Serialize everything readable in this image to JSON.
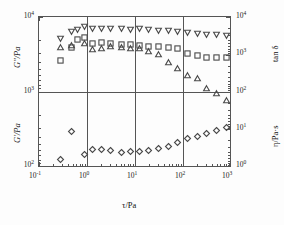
{
  "figure": {
    "name": "rheology-dual-panel-plot",
    "background": "#fdfdfd",
    "frame_color": "#555555",
    "marker_color": "#4a4a4a"
  },
  "axes": {
    "x_title": "τ/Pa",
    "y_left_top_title": "G″/Pa",
    "y_left_bottom_title": "G′/Pa",
    "y_right_top_title": "tan δ",
    "y_right_bottom_title": "η/Pa·s",
    "x_ticks": [
      "10",
      "10",
      "10",
      "10",
      "10"
    ],
    "x_tick_exponents": [
      "-1",
      "0",
      "1",
      "2",
      "3"
    ],
    "y_left_ticks": [
      "10",
      "10",
      "10"
    ],
    "y_left_exponents": [
      "4",
      "3",
      "2"
    ],
    "y_right_top_ticks": [
      "10",
      "10",
      "10"
    ],
    "y_right_top_exponents": [
      "4",
      "3",
      "2"
    ],
    "y_right_bottom_ticks": [
      "10",
      "10",
      "10"
    ],
    "y_right_bottom_exponents": [
      "2",
      "1",
      "0"
    ]
  },
  "chart_data": {
    "type": "scatter",
    "title": "",
    "xlabel": "τ/Pa",
    "ylabel": "G″/Pa, G′/Pa",
    "xscale": "log",
    "yscale": "log",
    "xlim": [
      0.1,
      1000
    ],
    "grid": "decade vertical rules at 1, 10, 100; horizontal rule at panel split",
    "legend": "none",
    "panels": [
      {
        "name": "upper-panel",
        "ylabel_left": "G″/Pa",
        "ylim_left": [
          1000,
          10000
        ],
        "ylabel_right": "tan δ",
        "ylim_right": [
          100,
          10000
        ]
      },
      {
        "name": "lower-panel",
        "ylabel_left": "G′/Pa",
        "ylim_left": [
          100,
          1000
        ],
        "ylabel_right": "η/Pa·s",
        "ylim_right": [
          1,
          100
        ]
      }
    ],
    "series": [
      {
        "name": "G-double-prime",
        "marker": "down-triangle",
        "axis": "left-upper",
        "x": [
          0.27,
          0.45,
          0.62,
          0.85,
          1.25,
          1.9,
          3.0,
          5.0,
          8.0,
          12.0,
          19.0,
          30.0,
          48.0,
          75.0,
          125.0,
          195.0,
          310.0,
          500.0,
          800.0
        ],
        "y": [
          5100,
          6500,
          6900,
          7500,
          7100,
          7050,
          7000,
          6950,
          6900,
          7050,
          6800,
          6700,
          6600,
          6500,
          6200,
          6050,
          5900,
          5800,
          5750
        ]
      },
      {
        "name": "G-double-prime-squares",
        "marker": "square",
        "axis": "left-upper",
        "x": [
          0.27,
          0.45,
          0.62,
          0.85,
          1.25,
          1.9,
          3.0,
          5.0,
          8.0,
          12.0,
          19.0,
          30.0,
          48.0,
          75.0,
          125.0,
          195.0,
          310.0,
          500.0,
          800.0
        ],
        "y": [
          2650,
          3900,
          5050,
          5300,
          4450,
          4600,
          4400,
          4350,
          4300,
          4200,
          4100,
          4000,
          3950,
          3850,
          3300,
          3050,
          2900,
          2850,
          2900
        ]
      },
      {
        "name": "tan-delta",
        "marker": "up-triangle",
        "axis": "right",
        "x": [
          0.27,
          0.45,
          0.85,
          1.25,
          1.9,
          3.0,
          5.0,
          8.0,
          12.0,
          19.0,
          30.0,
          48.0,
          75.0,
          125.0,
          195.0,
          310.0,
          500.0,
          800.0
        ],
        "y": [
          1580,
          1750,
          1950,
          1420,
          1430,
          1620,
          1600,
          1500,
          1500,
          1220,
          1000,
          620,
          420,
          290,
          230,
          130,
          95,
          62
        ]
      },
      {
        "name": "G-prime-eta",
        "marker": "diamond",
        "axis": "left-lower",
        "x": [
          0.27,
          0.45,
          0.85,
          1.25,
          1.9,
          3.0,
          5.0,
          8.0,
          12.0,
          19.0,
          30.0,
          48.0,
          75.0,
          125.0,
          195.0,
          310.0,
          500.0,
          800.0
        ],
        "y": [
          131,
          305,
          152,
          175,
          176,
          168,
          162,
          166,
          164,
          172,
          180,
          194,
          215,
          245,
          262,
          285,
          310,
          345
        ]
      }
    ]
  }
}
